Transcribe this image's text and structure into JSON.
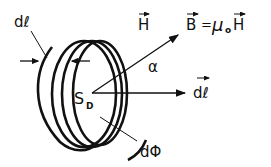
{
  "diagram": {
    "labels": {
      "dl_width": "dℓ",
      "H_vector": "H",
      "B_equation_B": "B",
      "B_equation_eq": "=",
      "B_equation_mu": "μ",
      "B_equation_sub": "o",
      "B_equation_H": "H",
      "alpha": "α",
      "dl_vector": "dℓ",
      "surface": "S",
      "surface_sub": "D",
      "flux": "dΦ"
    },
    "colors": {
      "stroke": "#111111",
      "background": "#ffffff"
    }
  }
}
